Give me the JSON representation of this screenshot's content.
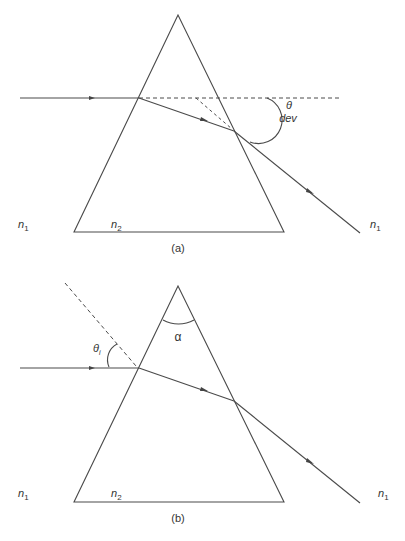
{
  "figure": {
    "panel_a": {
      "caption": "(a)",
      "medium_left": "n",
      "medium_left_sub": "1",
      "medium_prism": "n",
      "medium_prism_sub": "2",
      "medium_right": "n",
      "medium_right_sub": "1",
      "angle_symbol": "θ",
      "angle_label": "dev"
    },
    "panel_b": {
      "caption": "(b)",
      "medium_left": "n",
      "medium_left_sub": "1",
      "medium_prism": "n",
      "medium_prism_sub": "2",
      "medium_right": "n",
      "medium_right_sub": "1",
      "incidence_symbol": "θ",
      "incidence_sub": "i",
      "apex_angle": "α"
    },
    "colors": {
      "line": "#4a4a4a",
      "text": "#333333"
    }
  }
}
